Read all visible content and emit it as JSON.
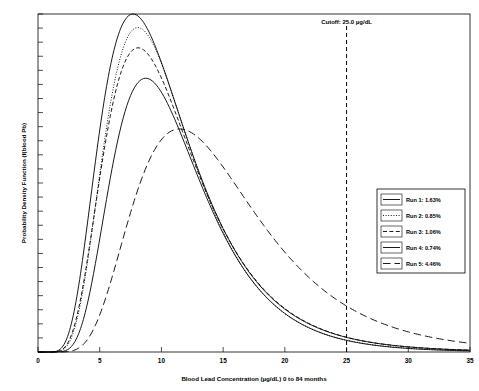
{
  "chart_data": {
    "type": "line",
    "title": "",
    "xlabel": "Blood Lead Concentration (µg/dL) 0 to 84 months",
    "ylabel": "Probability Density Function (f(blood Pb)",
    "xlim": [
      0,
      35
    ],
    "ylim": [
      0,
      1
    ],
    "xticks": [
      0,
      5,
      10,
      15,
      20,
      25,
      30,
      35
    ],
    "xtick_labels": [
      "0",
      "5",
      "10",
      "15",
      "20",
      "25",
      "30",
      "35"
    ],
    "ytick_labels": [],
    "ytick_count": 24,
    "grid": false,
    "legend_position": "lower-right",
    "annotations": [
      {
        "name": "cutoff",
        "text": "Cutoff: 25.0 µg/dL",
        "x": 25.0,
        "line_style": "dashed"
      }
    ],
    "series": [
      {
        "name": "Run 1",
        "legend_label": "Run 1:  1.63%",
        "exceedance_percent": 1.63,
        "line_style": "solid",
        "geomean": 9.6,
        "gsd": 1.6,
        "peak_x": 9.6,
        "peak_y": 1.0,
        "x": [
          0,
          1,
          2,
          3,
          4,
          5,
          6,
          7,
          8,
          9,
          10,
          11,
          12,
          13,
          14,
          15,
          16,
          17,
          18,
          19,
          20,
          22,
          25,
          28,
          30,
          32,
          35
        ],
        "y": [
          0.0,
          0.0,
          0.005,
          0.04,
          0.16,
          0.38,
          0.62,
          0.82,
          0.95,
          1.0,
          0.99,
          0.93,
          0.83,
          0.72,
          0.6,
          0.49,
          0.39,
          0.31,
          0.24,
          0.19,
          0.145,
          0.085,
          0.038,
          0.017,
          0.01,
          0.006,
          0.002
        ]
      },
      {
        "name": "Run 2",
        "legend_label": "Run 2:  0.85%",
        "exceedance_percent": 0.85,
        "line_style": "dotted",
        "geomean": 9.8,
        "gsd": 1.55,
        "peak_x": 9.9,
        "peak_y": 0.96,
        "x": [
          0,
          1,
          2,
          3,
          4,
          5,
          6,
          7,
          8,
          9,
          10,
          11,
          12,
          13,
          14,
          15,
          16,
          17,
          18,
          19,
          20,
          22,
          25,
          28,
          30,
          32,
          35
        ],
        "y": [
          0.0,
          0.0,
          0.003,
          0.03,
          0.14,
          0.35,
          0.59,
          0.79,
          0.92,
          0.96,
          0.955,
          0.9,
          0.81,
          0.7,
          0.58,
          0.47,
          0.37,
          0.285,
          0.22,
          0.17,
          0.13,
          0.073,
          0.03,
          0.013,
          0.007,
          0.004,
          0.0015
        ]
      },
      {
        "name": "Run 3",
        "legend_label": "Run 3:  1.06%",
        "exceedance_percent": 1.06,
        "line_style": "dashed",
        "geomean": 10.0,
        "gsd": 1.58,
        "peak_x": 10.1,
        "peak_y": 0.9,
        "x": [
          0,
          1,
          2,
          3,
          4,
          5,
          6,
          7,
          8,
          9,
          10,
          11,
          12,
          13,
          14,
          15,
          16,
          17,
          18,
          19,
          20,
          22,
          25,
          28,
          30,
          32,
          35
        ],
        "y": [
          0.0,
          0.0,
          0.002,
          0.025,
          0.12,
          0.31,
          0.54,
          0.73,
          0.86,
          0.895,
          0.9,
          0.86,
          0.79,
          0.69,
          0.59,
          0.48,
          0.385,
          0.3,
          0.235,
          0.18,
          0.14,
          0.08,
          0.034,
          0.015,
          0.009,
          0.005,
          0.002
        ]
      },
      {
        "name": "Run 4",
        "legend_label": "Run 4:  0.74%",
        "exceedance_percent": 0.74,
        "line_style": "solid",
        "geomean": 10.4,
        "gsd": 1.52,
        "peak_x": 10.5,
        "peak_y": 0.81,
        "x": [
          0,
          1,
          2,
          3,
          4,
          5,
          6,
          7,
          8,
          9,
          10,
          11,
          12,
          13,
          14,
          15,
          16,
          17,
          18,
          19,
          20,
          22,
          25,
          28,
          30,
          32,
          35
        ],
        "y": [
          0.0,
          0.0,
          0.001,
          0.015,
          0.08,
          0.23,
          0.43,
          0.61,
          0.74,
          0.8,
          0.81,
          0.785,
          0.73,
          0.65,
          0.56,
          0.465,
          0.375,
          0.295,
          0.23,
          0.175,
          0.135,
          0.077,
          0.031,
          0.013,
          0.0075,
          0.004,
          0.0015
        ]
      },
      {
        "name": "Run 5",
        "legend_label": "Run 5:  4.46%",
        "exceedance_percent": 4.46,
        "line_style": "long-dashed",
        "geomean": 13.9,
        "gsd": 1.55,
        "peak_x": 13.9,
        "peak_y": 0.66,
        "x": [
          0,
          2,
          3,
          4,
          5,
          6,
          7,
          8,
          9,
          10,
          11,
          12,
          13,
          14,
          15,
          16,
          17,
          18,
          19,
          20,
          21,
          22,
          24,
          25,
          27,
          30,
          32,
          35
        ],
        "y": [
          0.0,
          0.0,
          0.005,
          0.02,
          0.055,
          0.115,
          0.2,
          0.3,
          0.41,
          0.505,
          0.58,
          0.635,
          0.66,
          0.655,
          0.63,
          0.59,
          0.54,
          0.485,
          0.43,
          0.375,
          0.325,
          0.28,
          0.2,
          0.168,
          0.115,
          0.06,
          0.038,
          0.018
        ]
      }
    ]
  },
  "legend": {
    "items": [
      {
        "label": "Run 1:  1.63%",
        "style": "solid"
      },
      {
        "label": "Run 2:  0.85%",
        "style": "dotted"
      },
      {
        "label": "Run 3:  1.06%",
        "style": "dashed"
      },
      {
        "label": "Run 4:  0.74%",
        "style": "solid"
      },
      {
        "label": "Run 5:  4.46%",
        "style": "long-dashed"
      }
    ]
  }
}
